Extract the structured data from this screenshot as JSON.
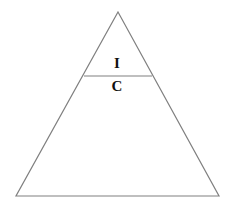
{
  "figure": {
    "type": "triangle-diagram",
    "background_color": "#ffffff",
    "stroke_color": "#808080",
    "stroke_width": 1.2,
    "label_color": "#111111",
    "outer_triangle": {
      "name": "outer-triangle",
      "apex": {
        "x": 118,
        "y": 12
      },
      "bottom_left": {
        "x": 16,
        "y": 196
      },
      "bottom_right": {
        "x": 219,
        "y": 196
      }
    },
    "divider_line": {
      "name": "horizontal-divider",
      "left": {
        "x": 84,
        "y": 76
      },
      "right": {
        "x": 152,
        "y": 76
      }
    },
    "labels": [
      {
        "id": "upper",
        "text": "I",
        "x": 117,
        "y": 63,
        "font_size": 15,
        "bold": true
      },
      {
        "id": "lower",
        "text": "C",
        "x": 117,
        "y": 86,
        "font_size": 15,
        "bold": true
      }
    ]
  },
  "chart_data": {
    "type": "diagram",
    "title": "",
    "shape": "triangle",
    "regions": [
      {
        "label": "I",
        "position": "top",
        "description": "small upper triangle above divider"
      },
      {
        "label": "C",
        "position": "bottom",
        "description": "large lower trapezoid below divider"
      }
    ],
    "annotations": [
      "I",
      "C"
    ]
  }
}
